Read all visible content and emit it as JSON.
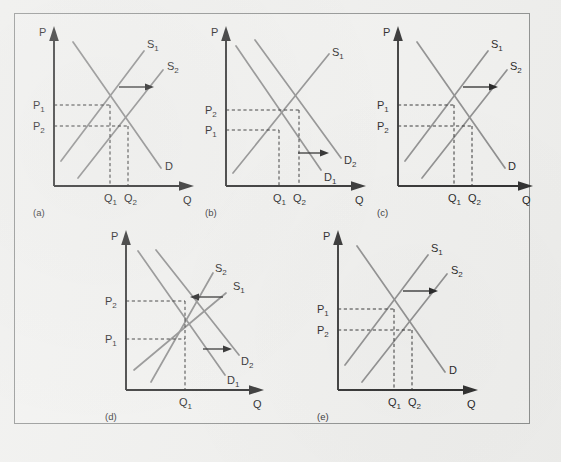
{
  "figure": {
    "type": "economics-supply-demand-panels",
    "background_color": "#efefed",
    "frame_border_color": "#8d8f8e",
    "curve_color": "#8c8c8c",
    "axis_color": "#2a2a2a",
    "guide_color": "#2a2a2a",
    "axis_labels": {
      "vertical": "P",
      "horizontal": "Q"
    }
  },
  "panels": [
    {
      "id": "a",
      "letter": "(a)",
      "axis_y": "P",
      "axis_x": "Q",
      "price_labels": [
        {
          "text": "P",
          "sub": "1",
          "position": "upper"
        },
        {
          "text": "P",
          "sub": "2",
          "position": "lower"
        }
      ],
      "quantity_labels": [
        {
          "text": "Q",
          "sub": "1",
          "position": "left"
        },
        {
          "text": "Q",
          "sub": "2",
          "position": "right"
        }
      ],
      "curve_labels": [
        {
          "text": "S",
          "sub": "1"
        },
        {
          "text": "S",
          "sub": "2"
        },
        {
          "text": "D",
          "sub": ""
        }
      ],
      "shift": {
        "curve": "supply",
        "direction": "right"
      },
      "description": "Supply shifts right: price falls from P1 to P2, quantity rises from Q1 to Q2"
    },
    {
      "id": "b",
      "letter": "(b)",
      "axis_y": "P",
      "axis_x": "Q",
      "price_labels": [
        {
          "text": "P",
          "sub": "2",
          "position": "upper"
        },
        {
          "text": "P",
          "sub": "1",
          "position": "lower"
        }
      ],
      "quantity_labels": [
        {
          "text": "Q",
          "sub": "1",
          "position": "left"
        },
        {
          "text": "Q",
          "sub": "2",
          "position": "right"
        }
      ],
      "curve_labels": [
        {
          "text": "S",
          "sub": "1"
        },
        {
          "text": "D",
          "sub": "2"
        },
        {
          "text": "D",
          "sub": "1"
        }
      ],
      "shift": {
        "curve": "demand",
        "direction": "right"
      },
      "description": "Demand shifts right: price rises from P1 to P2, quantity rises from Q1 to Q2"
    },
    {
      "id": "c",
      "letter": "(c)",
      "axis_y": "P",
      "axis_x": "Q",
      "price_labels": [
        {
          "text": "P",
          "sub": "1",
          "position": "upper"
        },
        {
          "text": "P",
          "sub": "2",
          "position": "lower"
        }
      ],
      "quantity_labels": [
        {
          "text": "Q",
          "sub": "1",
          "position": "left"
        },
        {
          "text": "Q",
          "sub": "2",
          "position": "right"
        }
      ],
      "curve_labels": [
        {
          "text": "S",
          "sub": "1"
        },
        {
          "text": "S",
          "sub": "2"
        },
        {
          "text": "D",
          "sub": ""
        }
      ],
      "shift": {
        "curve": "supply",
        "direction": "right"
      },
      "description": "Supply shifts right: price falls from P1 to P2, quantity rises from Q1 to Q2"
    },
    {
      "id": "d",
      "letter": "(d)",
      "axis_y": "P",
      "axis_x": "Q",
      "price_labels": [
        {
          "text": "P",
          "sub": "2",
          "position": "upper"
        },
        {
          "text": "P",
          "sub": "1",
          "position": "lower"
        }
      ],
      "quantity_labels": [
        {
          "text": "Q",
          "sub": "1",
          "position": "center"
        }
      ],
      "curve_labels": [
        {
          "text": "S",
          "sub": "2"
        },
        {
          "text": "S",
          "sub": "1"
        },
        {
          "text": "D",
          "sub": "2"
        },
        {
          "text": "D",
          "sub": "1"
        }
      ],
      "shift": {
        "curve": "both",
        "direction": "supply-left-demand-right"
      },
      "description": "Supply shifts left and demand shifts right: price rises from P1 to P2, quantity unchanged at Q1"
    },
    {
      "id": "e",
      "letter": "(e)",
      "axis_y": "P",
      "axis_x": "Q",
      "price_labels": [
        {
          "text": "P",
          "sub": "1",
          "position": "upper"
        },
        {
          "text": "P",
          "sub": "2",
          "position": "lower"
        }
      ],
      "quantity_labels": [
        {
          "text": "Q",
          "sub": "1",
          "position": "left"
        },
        {
          "text": "Q",
          "sub": "2",
          "position": "right"
        }
      ],
      "curve_labels": [
        {
          "text": "S",
          "sub": "1"
        },
        {
          "text": "S",
          "sub": "2"
        },
        {
          "text": "D",
          "sub": ""
        }
      ],
      "shift": {
        "curve": "supply",
        "direction": "right"
      },
      "description": "Supply shifts right: price falls from P1 to P2, quantity rises from Q1 to Q2"
    }
  ]
}
